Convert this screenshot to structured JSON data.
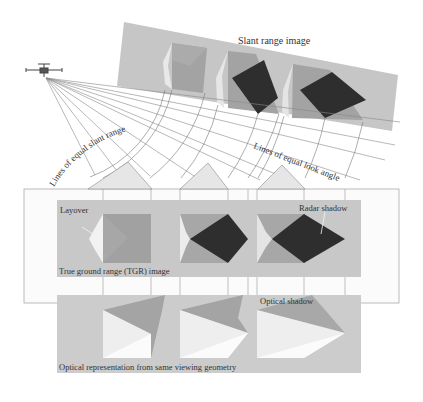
{
  "labels": {
    "slant_range_image": "Slant range image",
    "lines_equal_slant_range": "Lines of equal slant range",
    "lines_equal_look_angle": "Lines of equal look angle",
    "layover": "Layover",
    "radar_shadow": "Radar shadow",
    "tgr_image": "True ground range (TGR) image",
    "optical_shadow": "Optical shadow",
    "optical_representation": "Optical representation from same viewing geometry"
  },
  "icons": {
    "platform": "aircraft-icon"
  },
  "colors": {
    "panel_bg": "#c8c8c8",
    "light_face": "#eeeeee",
    "mid_face": "#a8a8a8",
    "dark_face": "#9a9a9a",
    "shadow": "#2e2e2e",
    "line": "#777777",
    "ground_box": "#f8f8f8"
  }
}
